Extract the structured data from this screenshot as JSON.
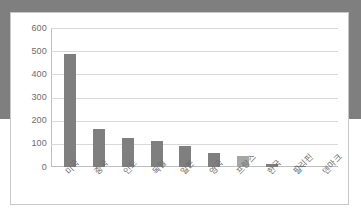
{
  "chart_data": {
    "type": "bar",
    "title": "",
    "subtitle": "",
    "xlabel": "",
    "ylabel": "",
    "categories": [
      "미국",
      "중국",
      "인도",
      "독일",
      "일본",
      "영국",
      "프랑스",
      "한국",
      "필리핀",
      "덴마크"
    ],
    "values": [
      517,
      493,
      164,
      128,
      112,
      90,
      63,
      48,
      15,
      5
    ],
    "ylim": [
      0,
      600
    ],
    "ytick_labels": [
      "600",
      "500",
      "400",
      "300",
      "200",
      "100",
      "0"
    ],
    "ytick_values": [
      600,
      500,
      400,
      300,
      200,
      100,
      0
    ],
    "grid": true,
    "legend": "none",
    "bar_colors": [
      "#7f7f7f",
      "#7f7f7f",
      "#7f7f7f",
      "#7f7f7f",
      "#7f7f7f",
      "#7f7f7f",
      "#7f7f7f",
      "#a6a6a6",
      "#7f7f7f",
      "#7f7f7f"
    ],
    "highlight_category": "한국",
    "colors": {
      "bar_default": "#7f7f7f",
      "bar_highlight": "#a6a6a6",
      "gridline": "#d9d9d9",
      "axis": "#bfbfbf",
      "tick_text": "#6d6d6d",
      "frame_border": "#c8c8c8",
      "background": "#ffffff"
    }
  }
}
